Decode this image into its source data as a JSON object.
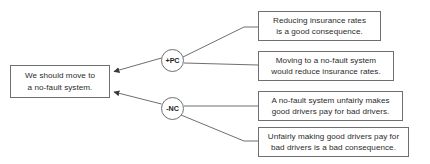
{
  "diagram": {
    "line_color": "#6f6f6f",
    "text_color": "#2b2b2b",
    "background": "#ffffff"
  },
  "claim": {
    "id": "claim-box",
    "text": "We should move to\na no-fault system."
  },
  "relations": [
    {
      "id": "pro-node",
      "label": "+PC",
      "kind": "pro"
    },
    {
      "id": "con-node",
      "label": "-NC",
      "kind": "con"
    }
  ],
  "reasons": [
    {
      "id": "reason-box-1",
      "text": "Reducing insurance rates\nis a good consequence."
    },
    {
      "id": "reason-box-2",
      "text": "Moving to a no-fault system\nwould reduce insurance rates."
    },
    {
      "id": "reason-box-3",
      "text": "A no-fault system unfairly makes\ngood drivers pay for bad drivers."
    },
    {
      "id": "reason-box-4",
      "text": "Unfairly making good drivers pay for\nbad drivers is a bad consequence."
    }
  ]
}
